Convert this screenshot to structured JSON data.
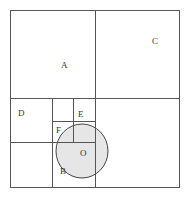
{
  "diagram": {
    "type": "quadtree-partition",
    "colors": {
      "line": "#555555",
      "circle_fill": "#e6e6e6",
      "circle_stroke": "#444444",
      "label": "#333333"
    },
    "circle": {
      "cx": 82,
      "cy": 151,
      "rx": 26,
      "ry": 27
    },
    "labels": {
      "A": "A",
      "B": "B",
      "C": "C",
      "D": "D",
      "E": "E",
      "F": "F",
      "O": "O"
    }
  }
}
